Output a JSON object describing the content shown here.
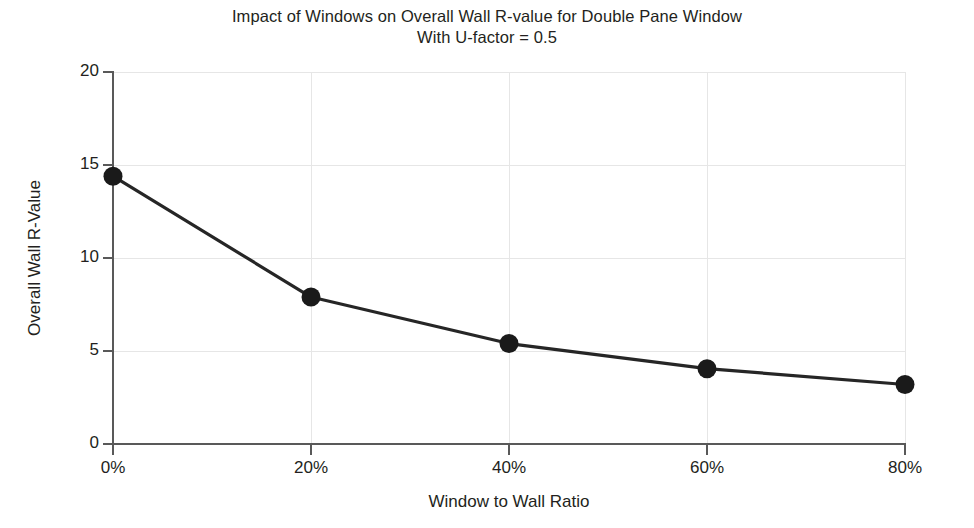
{
  "chart_data": {
    "type": "line",
    "title": "Impact of Windows on Overall Wall R-value for Double Pane Window",
    "subtitle": "With U-factor = 0.5",
    "xlabel": "Window to Wall Ratio",
    "ylabel": "Overall Wall R-Value",
    "categories": [
      "0%",
      "20%",
      "40%",
      "60%",
      "80%"
    ],
    "x": [
      0,
      20,
      40,
      60,
      80
    ],
    "values": [
      14.4,
      7.9,
      5.4,
      4.05,
      3.2
    ],
    "series": [
      {
        "name": "Overall Wall R-Value",
        "values": [
          14.4,
          7.9,
          5.4,
          4.05,
          3.2
        ]
      }
    ],
    "xlim": [
      0,
      80
    ],
    "ylim": [
      0,
      20
    ],
    "x_ticks": [
      0,
      20,
      40,
      60,
      80
    ],
    "x_tick_labels": [
      "0%",
      "20%",
      "40%",
      "60%",
      "80%"
    ],
    "y_ticks": [
      0,
      5,
      10,
      15,
      20
    ],
    "y_tick_labels": [
      "0",
      "5",
      "10",
      "15",
      "20"
    ],
    "grid": true,
    "legend": false,
    "legend_position": "none",
    "line_color": "#262626",
    "marker_color": "#1a1a1a",
    "marker_shape": "circle",
    "grid_color": "#e6e6e6",
    "axis_color": "#595959",
    "background_color": "#ffffff"
  }
}
